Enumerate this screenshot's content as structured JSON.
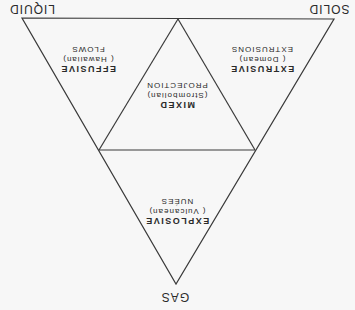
{
  "diagram": {
    "orientation": "rotated 180 degrees",
    "line_color": "#3a3a3a",
    "vertices": {
      "gas": "GAS",
      "liquid": "LIQUID",
      "solid": "SOLID"
    },
    "regions": {
      "explosive": {
        "title": "EXPLOSIVE",
        "subtitle": "( Vulcanean)",
        "detail": "NUÉES"
      },
      "effusive": {
        "title": "EFFUSIVE",
        "subtitle": "( Hawaiian)",
        "detail": "FLOWS"
      },
      "extrusive": {
        "title": "EXTRUSIVE",
        "subtitle": "( Domean)",
        "detail": "EXTRUSIONS"
      },
      "mixed": {
        "title": "MIXED",
        "subtitle": "(Strombolian)",
        "detail": "PROJECTION"
      }
    }
  }
}
